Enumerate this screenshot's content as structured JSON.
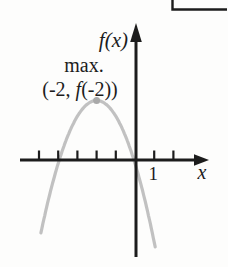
{
  "figure": {
    "type": "textbook-function-graph",
    "background": "#fdfdfc",
    "axis_color": "#1c1c1c",
    "curve_color": "#c1c1c1",
    "vertex_dot_color": "#a9a9a9",
    "y_axis_label": "f(x)",
    "x_axis_label": "x",
    "tick_label_1": "1",
    "annotation": {
      "line1": "max.",
      "line2": "(-2, f(-2))",
      "line2_parts": [
        "(-2, ",
        "f",
        "(-2))"
      ]
    }
  },
  "chart_data": {
    "type": "line",
    "title": "",
    "xlabel": "x",
    "ylabel": "f(x)",
    "grid": false,
    "legend": "none",
    "x_ticks": [
      -5,
      -4,
      -3,
      -2,
      -1,
      1,
      2
    ],
    "x_tick_labels": [
      {
        "value": 1,
        "label": "1"
      }
    ],
    "annotations": [
      {
        "text": "max.",
        "target": "vertex"
      },
      {
        "text": "(-2, f(-2))",
        "target": "vertex"
      }
    ],
    "marked_point": {
      "x": -2,
      "y": 3.1,
      "label": "(-2, f(-2))"
    },
    "series": [
      {
        "name": "f(x)",
        "shape": "downward-parabola",
        "color": "#c1c1c1",
        "vertex": [
          -2,
          3.1
        ],
        "coefficient": -0.82,
        "x_range": [
          -4.9,
          1.05
        ],
        "points": [
          [
            -4.9,
            -3.8
          ],
          [
            -3.95,
            0
          ],
          [
            -3,
            2.3
          ],
          [
            -2,
            3.1
          ],
          [
            -1,
            2.3
          ],
          [
            -0.05,
            0
          ],
          [
            1.05,
            -4.5
          ]
        ]
      }
    ]
  }
}
